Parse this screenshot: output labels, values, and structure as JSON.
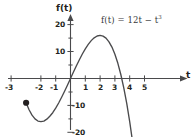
{
  "chart_data": {
    "type": "line",
    "title": "",
    "equation_label": "f(t) = 12t − t",
    "equation_exponent": "3",
    "xlabel": "t",
    "ylabel": "f(t)",
    "xlim": [
      -3.4,
      5.4
    ],
    "ylim": [
      -22,
      22
    ],
    "xticks": [
      -3,
      -2,
      -1,
      1,
      2,
      3,
      4,
      5
    ],
    "xticklabels": [
      "-3",
      "-2",
      "-1",
      "1",
      "2",
      "3",
      "4",
      "5"
    ],
    "yticks": [
      -20,
      -10,
      10,
      20
    ],
    "yticklabels": [
      "-20",
      "-10",
      "10",
      "20"
    ],
    "grid": false,
    "legend": "none",
    "axis_arrows": [
      "x-right",
      "y-top"
    ],
    "series": [
      {
        "name": "f(t) = 12t - t^3",
        "color": "#4a4a4c",
        "x": [
          -3.0,
          -2.8,
          -2.6,
          -2.4,
          -2.2,
          -2.0,
          -1.8,
          -1.6,
          -1.4,
          -1.2,
          -1.0,
          -0.8,
          -0.6,
          -0.4,
          -0.2,
          0.0,
          0.2,
          0.4,
          0.6,
          0.8,
          1.0,
          1.2,
          1.4,
          1.6,
          1.8,
          2.0,
          2.2,
          2.4,
          2.6,
          2.8,
          3.0,
          3.2,
          3.4,
          3.6,
          3.8,
          4.0,
          4.2,
          4.35
        ],
        "y": [
          -9.0,
          -11.6,
          -13.6,
          -15.0,
          -15.8,
          -16.0,
          -15.8,
          -15.1,
          -14.0,
          -12.7,
          -11.0,
          -9.1,
          -6.98,
          -4.74,
          -2.39,
          0.0,
          2.39,
          4.74,
          6.98,
          9.09,
          11.0,
          12.67,
          14.06,
          15.1,
          15.77,
          16.0,
          15.75,
          15.0,
          13.62,
          11.65,
          9.0,
          5.63,
          1.49,
          -3.46,
          -9.27,
          -16.0,
          -23.69,
          -30.1
        ]
      }
    ],
    "markers": [
      {
        "name": "left-endpoint",
        "x": -3.0,
        "y": -9.0,
        "style": "filled-circle",
        "color": "#231f20"
      }
    ]
  },
  "axes": {
    "x_axis_name": "t-axis",
    "y_axis_name": "f-of-t-axis"
  }
}
